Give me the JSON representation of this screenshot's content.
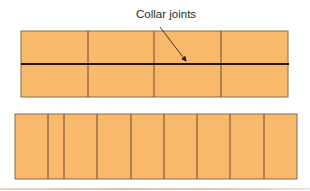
{
  "annotation": {
    "label": "Collar joints",
    "arrow": {
      "from": [
        160,
        27
      ],
      "to": [
        187,
        62
      ]
    }
  },
  "colors": {
    "brick_fill": "#f8b96c",
    "joint_line": "#6b4a2a",
    "collar_joint": "#2b1608",
    "outline": "#8a6a4a",
    "rule": "#d9c2a8"
  },
  "top_wall": {
    "description": "Two wythes of bricks in running bond with a continuous collar joint",
    "x": 21,
    "y": 31,
    "width": 267,
    "height": 66,
    "collar_joint_y": 64,
    "vertical_joints_x": [
      88,
      154,
      221
    ],
    "courses": 2,
    "bricks_per_course": 4
  },
  "bottom_wall": {
    "description": "Single course of header bricks",
    "x": 15,
    "y": 114,
    "width": 282,
    "height": 65,
    "vertical_joints_x": [
      48,
      64,
      97,
      131,
      164,
      197,
      230,
      264
    ],
    "brick_count": 9
  }
}
